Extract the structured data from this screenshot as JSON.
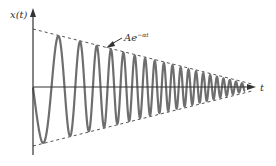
{
  "figure": {
    "y_axis_label": "x(t)",
    "x_axis_label": "t",
    "envelope_label_base": "Ae",
    "envelope_label_exp": "−αt",
    "colors": {
      "axis": "#333333",
      "signal": "#6e6e6e",
      "envelope": "#555555",
      "background": "#ffffff"
    }
  },
  "chart_data": {
    "type": "line",
    "title": "",
    "xlabel": "t",
    "ylabel": "x(t)",
    "series": [
      {
        "name": "x(t)",
        "style": "solid",
        "note": "oscillating signal, amplitude decaying, frequency increasing"
      },
      {
        "name": "Ae^{-αt}",
        "style": "dashed",
        "note": "upper envelope"
      },
      {
        "name": "-Ae^{-αt}",
        "style": "dashed",
        "note": "lower envelope"
      }
    ],
    "annotations": [
      "Ae^{−αt} with arrow pointing to upper envelope"
    ],
    "grid": false,
    "legend": "none"
  }
}
